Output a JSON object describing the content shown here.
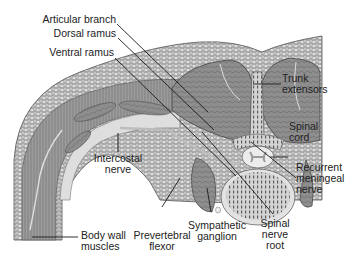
{
  "figure": {
    "colors": {
      "background": "#ffffff",
      "skin": "#b8b8b8",
      "fat": "#d6d6d6",
      "muscle": "#8c8c8c",
      "fascia": "#e8e8e8",
      "bone": "#6e6e6e",
      "leader_line": "#1a1a1a",
      "text": "#222222"
    }
  },
  "labels": {
    "articular_branch": "Articular branch",
    "dorsal_ramus": "Dorsal ramus",
    "ventral_ramus": "Ventral ramus",
    "trunk_extensors_1": "Trunk",
    "trunk_extensors_2": "extensors",
    "spinal_cord_1": "Spinal",
    "spinal_cord_2": "cord",
    "intercostal_nerve_1": "Intercostal",
    "intercostal_nerve_2": "nerve",
    "recurrent_meningeal_1": "Recurrent",
    "recurrent_meningeal_2": "meningeal",
    "recurrent_meningeal_3": "nerve",
    "body_wall_1": "Body wall",
    "body_wall_2": "muscles",
    "prevertebral_1": "Prevertebral",
    "prevertebral_2": "flexor",
    "sympathetic_1": "Sympathetic",
    "sympathetic_2": "ganglion",
    "spinal_root_1": "Spinal",
    "spinal_root_2": "nerve",
    "spinal_root_3": "root"
  }
}
